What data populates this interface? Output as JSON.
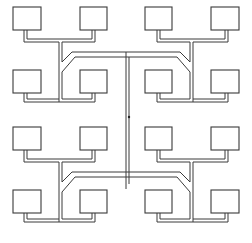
{
  "diagram": {
    "title": "",
    "colors": {
      "line": "#3a3a3a",
      "background": "#ffffff"
    },
    "center_marker": {
      "x": 129,
      "y": 117
    },
    "quadrants": [
      {
        "id": "top-left",
        "ox": 0,
        "oy": 0,
        "mirror_x": false,
        "mirror_y": false
      },
      {
        "id": "top-right",
        "ox": 252,
        "oy": 0,
        "mirror_x": true,
        "mirror_y": false
      },
      {
        "id": "bottom-left",
        "ox": 0,
        "oy": 120,
        "mirror_x": false,
        "mirror_y": false
      },
      {
        "id": "bottom-right",
        "ox": 252,
        "oy": 120,
        "mirror_x": true,
        "mirror_y": false
      }
    ],
    "node_count": 16
  }
}
